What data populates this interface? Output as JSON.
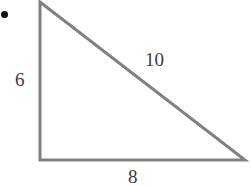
{
  "figure": {
    "kind": "right-triangle-diagram",
    "canvas": {
      "width": 251,
      "height": 186,
      "background_color": "#ffffff"
    },
    "stroke": {
      "color": "#808080",
      "width": 3
    },
    "text_color": "#3b3b3b",
    "bullet": {
      "name": "bullet-marker",
      "color": "#111111",
      "cx": 4,
      "cy": 14,
      "r": 3.5
    },
    "vertices": {
      "apex": {
        "x": 40,
        "y": 2
      },
      "bottom_left": {
        "x": 40,
        "y": 160
      },
      "bottom_right": {
        "x": 245,
        "y": 160
      }
    },
    "labels": {
      "vertical_leg": "6",
      "hypotenuse": "10",
      "horizontal_leg": "8"
    }
  },
  "chart_data": {
    "type": "diagram",
    "title": "",
    "shape": "right triangle",
    "sides": [
      {
        "name": "vertical leg",
        "label": "6",
        "value": 6,
        "from": "apex",
        "to": "bottom_left"
      },
      {
        "name": "horizontal leg",
        "label": "8",
        "value": 8,
        "from": "bottom_left",
        "to": "bottom_right"
      },
      {
        "name": "hypotenuse",
        "label": "10",
        "value": 10,
        "from": "apex",
        "to": "bottom_right"
      }
    ],
    "right_angle_at": "bottom_left",
    "xlabel": "",
    "ylabel": ""
  }
}
